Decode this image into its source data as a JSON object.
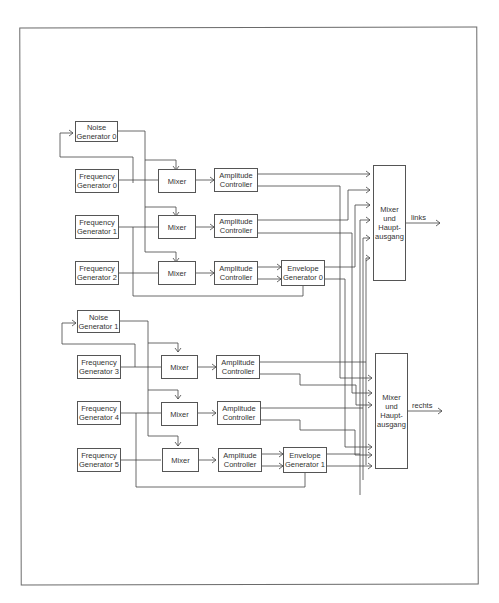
{
  "diagram": {
    "upper": {
      "noise": {
        "line1": "Noise",
        "line2": "Generator 0"
      },
      "freq": [
        {
          "line1": "Frequency",
          "line2": "Generator 0"
        },
        {
          "line1": "Frequency",
          "line2": "Generator 1"
        },
        {
          "line1": "Frequency",
          "line2": "Generator 2"
        }
      ],
      "mixers": [
        "Mixer",
        "Mixer",
        "Mixer"
      ],
      "amps": [
        {
          "line1": "Amplitude",
          "line2": "Controller"
        },
        {
          "line1": "Amplitude",
          "line2": "Controller"
        },
        {
          "line1": "Amplitude",
          "line2": "Controller"
        }
      ],
      "envelope": {
        "line1": "Envelope",
        "line2": "Generator 0"
      },
      "main_mixer": {
        "line1": "Mixer",
        "line2": "und",
        "line3": "Haupt-",
        "line4": "ausgang"
      },
      "output_label": "links"
    },
    "lower": {
      "noise": {
        "line1": "Noise",
        "line2": "Generator 1"
      },
      "freq": [
        {
          "line1": "Frequency",
          "line2": "Generator 3"
        },
        {
          "line1": "Frequency",
          "line2": "Generator 4"
        },
        {
          "line1": "Frequency",
          "line2": "Generator 5"
        }
      ],
      "mixers": [
        "Mixer",
        "Mixer",
        "Mixer"
      ],
      "amps": [
        {
          "line1": "Amplitude",
          "line2": "Controller"
        },
        {
          "line1": "Amplitude",
          "line2": "Controller"
        },
        {
          "line1": "Amplitude",
          "line2": "Controller"
        }
      ],
      "envelope": {
        "line1": "Envelope",
        "line2": "Generator 1"
      },
      "main_mixer": {
        "line1": "Mixer",
        "line2": "und",
        "line3": "Haupt-",
        "line4": "ausgang"
      },
      "output_label": "rechts"
    }
  }
}
